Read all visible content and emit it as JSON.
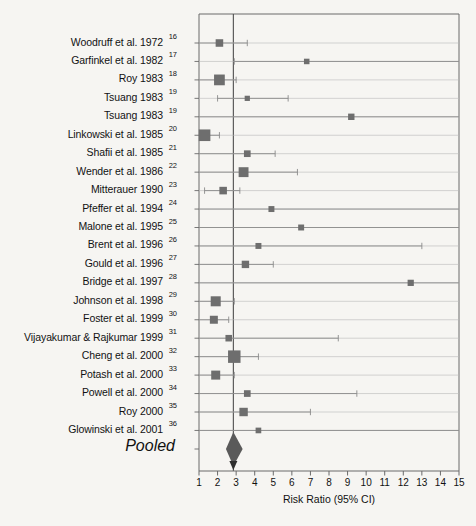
{
  "chart_data": {
    "type": "scatter",
    "subtype": "forest-plot",
    "title": "",
    "xlabel": "Risk Ratio (95% CI)",
    "ylabel": "",
    "xlim": [
      1,
      15
    ],
    "xticks": [
      1,
      2,
      3,
      4,
      5,
      6,
      7,
      8,
      9,
      10,
      11,
      12,
      13,
      14,
      15
    ],
    "grid": true,
    "legend": false,
    "reference_line": 2.85,
    "effect_measure": "Risk Ratio",
    "confidence_level": "95%",
    "categories": [
      "Woodruff et al. 1972",
      "Garfinkel et al. 1982",
      "Roy 1983",
      "Tsuang 1983",
      "Tsuang 1983",
      "Linkowski et al. 1985",
      "Shafii et al. 1985",
      "Wender et al. 1986",
      "Mitterauer 1990",
      "Pfeffer et al. 1994",
      "Malone et al. 1995",
      "Brent et al. 1996",
      "Gould et al. 1996",
      "Bridge et al. 1997",
      "Johnson et al. 1998",
      "Foster et al. 1999",
      "Vijayakumar & Rajkumar 1999",
      "Cheng et al. 2000",
      "Potash et al. 2000",
      "Powell et al. 2000",
      "Roy 2000",
      "Glowinski et al. 2001"
    ],
    "reference_numbers": [
      "16",
      "17",
      "18",
      "19",
      "19",
      "20",
      "21",
      "22",
      "23",
      "24",
      "25",
      "26",
      "27",
      "28",
      "29",
      "30",
      "31",
      "32",
      "33",
      "34",
      "35",
      "36"
    ],
    "studies": [
      {
        "label": "Woodruff et al. 1972",
        "ref": "16",
        "rr": 2.1,
        "lo": 1.0,
        "hi": 3.6,
        "weight": 3.0
      },
      {
        "label": "Garfinkel et al. 1982",
        "ref": "17",
        "rr": 6.8,
        "lo": 2.9,
        "hi": 15.0,
        "weight": 1.6
      },
      {
        "label": "Roy 1983",
        "ref": "18",
        "rr": 2.1,
        "lo": 1.0,
        "hi": 3.0,
        "weight": 5.2
      },
      {
        "label": "Tsuang 1983",
        "ref": "19",
        "rr": 3.6,
        "lo": 2.0,
        "hi": 5.8,
        "weight": 1.4
      },
      {
        "label": "Tsuang 1983",
        "ref": "19",
        "rr": 9.2,
        "lo": 1.0,
        "hi": 15.0,
        "weight": 2.2
      },
      {
        "label": "Linkowski et al. 1985",
        "ref": "20",
        "rr": 1.3,
        "lo": 1.0,
        "hi": 2.1,
        "weight": 5.8
      },
      {
        "label": "Shafii et al. 1985",
        "ref": "21",
        "rr": 3.6,
        "lo": 1.0,
        "hi": 5.1,
        "weight": 2.4
      },
      {
        "label": "Wender et al. 1986",
        "ref": "22",
        "rr": 3.4,
        "lo": 1.0,
        "hi": 6.3,
        "weight": 4.6
      },
      {
        "label": "Mitterauer 1990",
        "ref": "23",
        "rr": 2.3,
        "lo": 1.3,
        "hi": 3.2,
        "weight": 3.0
      },
      {
        "label": "Pfeffer et al. 1994",
        "ref": "24",
        "rr": 4.9,
        "lo": 1.0,
        "hi": 15.0,
        "weight": 1.9
      },
      {
        "label": "Malone et al. 1995",
        "ref": "25",
        "rr": 6.5,
        "lo": 1.0,
        "hi": 15.0,
        "weight": 1.9
      },
      {
        "label": "Brent et al. 1996",
        "ref": "26",
        "rr": 4.2,
        "lo": 1.0,
        "hi": 13.0,
        "weight": 1.9
      },
      {
        "label": "Gould et al. 1996",
        "ref": "27",
        "rr": 3.5,
        "lo": 1.0,
        "hi": 5.0,
        "weight": 2.9
      },
      {
        "label": "Bridge et al. 1997",
        "ref": "28",
        "rr": 12.4,
        "lo": 1.0,
        "hi": 15.0,
        "weight": 2.1
      },
      {
        "label": "Johnson et al. 1998",
        "ref": "29",
        "rr": 1.9,
        "lo": 1.0,
        "hi": 2.9,
        "weight": 4.7
      },
      {
        "label": "Foster et al. 1999",
        "ref": "30",
        "rr": 1.8,
        "lo": 1.0,
        "hi": 2.6,
        "weight": 3.3
      },
      {
        "label": "Vijayakumar & Rajkumar 1999",
        "ref": "31",
        "rr": 2.6,
        "lo": 1.0,
        "hi": 8.5,
        "weight": 2.3
      },
      {
        "label": "Cheng et al. 2000",
        "ref": "32",
        "rr": 2.9,
        "lo": 1.0,
        "hi": 4.2,
        "weight": 6.4
      },
      {
        "label": "Potash et al. 2000",
        "ref": "33",
        "rr": 1.9,
        "lo": 1.0,
        "hi": 2.9,
        "weight": 4.0
      },
      {
        "label": "Powell et al. 2000",
        "ref": "34",
        "rr": 3.6,
        "lo": 1.0,
        "hi": 9.5,
        "weight": 2.4
      },
      {
        "label": "Roy 2000",
        "ref": "35",
        "rr": 3.4,
        "lo": 1.0,
        "hi": 7.0,
        "weight": 3.6
      },
      {
        "label": "Glowinski et al. 2001",
        "ref": "36",
        "rr": 4.2,
        "lo": 1.0,
        "hi": 15.0,
        "weight": 1.7
      }
    ],
    "pooled": {
      "label": "Pooled",
      "rr": 2.85,
      "lo": 2.45,
      "hi": 3.35
    }
  }
}
